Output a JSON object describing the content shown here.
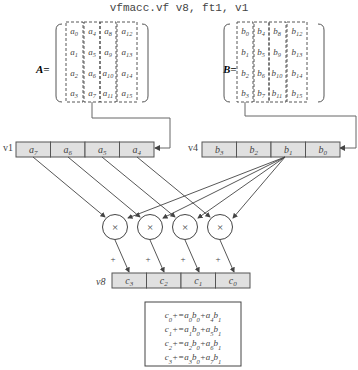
{
  "title": "vfmacc.vf v8, ft1, v1",
  "matrix_a": {
    "label": "A=",
    "cells": [
      [
        "a0",
        "a4",
        "a8",
        "a12"
      ],
      [
        "a1",
        "a5",
        "a9",
        "a13"
      ],
      [
        "a2",
        "a6",
        "a10",
        "a14"
      ],
      [
        "a3",
        "a7",
        "a11",
        "a15"
      ]
    ]
  },
  "matrix_b": {
    "label": "B=",
    "cells": [
      [
        "b0",
        "b4",
        "b8",
        "b12"
      ],
      [
        "b1",
        "b5",
        "b9",
        "b13"
      ],
      [
        "b2",
        "b6",
        "b10",
        "b14"
      ],
      [
        "b3",
        "b7",
        "b11",
        "b15"
      ]
    ]
  },
  "v1": {
    "label": "v1",
    "cells": [
      "a7",
      "a6",
      "a5",
      "a4"
    ]
  },
  "v4": {
    "label": "v4",
    "cells": [
      "b3",
      "b2",
      "b1",
      "b0"
    ]
  },
  "v8": {
    "label": "v8",
    "cells": [
      "c3",
      "c2",
      "c1",
      "c0"
    ]
  },
  "multipliers": [
    "×",
    "×",
    "×",
    "×"
  ],
  "plus_signs": [
    "+",
    "+",
    "+",
    "+"
  ],
  "equations": [
    "c0+=a0b0+a4b1",
    "c1+=a1b0+a5b1",
    "c2+=a2b0+a6b1",
    "c3+=a3b0+a7b1"
  ],
  "colors": {
    "cell_fill": "#e0e0e0",
    "stroke": "#555555"
  }
}
